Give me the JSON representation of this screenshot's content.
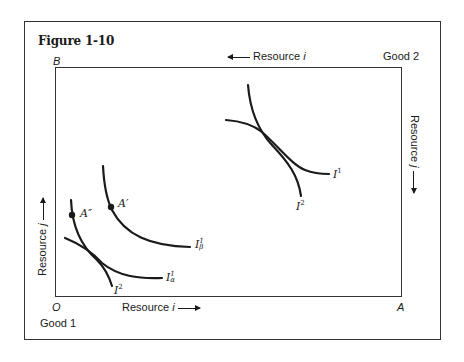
{
  "figure": {
    "title": "Figure 1-10"
  },
  "corners": {
    "top_left": "B",
    "bottom_left": "O",
    "bottom_right": "A",
    "good_1": "Good 1",
    "good_2": "Good 2"
  },
  "axes": {
    "bottom": {
      "text": "Resource ",
      "var": "i",
      "direction": "right"
    },
    "top": {
      "text": "Resource ",
      "var": "i",
      "direction": "left"
    },
    "left": {
      "text": "Resource ",
      "var": "j",
      "direction": "up"
    },
    "right": {
      "text": "Resource ",
      "var": "j",
      "direction": "down"
    }
  },
  "points": {
    "a_prime": "A′",
    "a_double_prime": "A″"
  },
  "curves": {
    "upper_right": {
      "i1": {
        "base": "I",
        "sup": "1"
      },
      "i2": {
        "base": "I",
        "sup": "2"
      }
    },
    "lower_left": {
      "i_beta": {
        "base": "I",
        "sup": "1",
        "sub": "β"
      },
      "i_alpha": {
        "base": "I",
        "sup": "1",
        "sub": "α"
      },
      "i2": {
        "base": "I",
        "sup": "2"
      }
    }
  },
  "colors": {
    "line": "#1a1a1a",
    "frame": "#333333",
    "background": "#ffffff"
  }
}
